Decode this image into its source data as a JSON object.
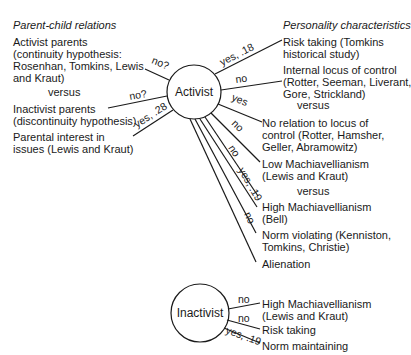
{
  "left": {
    "header": "Parent-child relations",
    "items": [
      {
        "lines": [
          "Activist parents",
          "(continuity hypothesis:",
          "Rosenhan, Tomkins, Lewis",
          "and Kraut)"
        ]
      },
      {
        "lines": [
          "versus"
        ]
      },
      {
        "lines": [
          "Inactivist parents",
          "(discontinuity hypothesis)"
        ]
      },
      {
        "lines": [
          "Parental interest in",
          "issues (Lewis and Kraut)"
        ]
      }
    ]
  },
  "right": {
    "header": "Personality characteristics",
    "items": [
      {
        "lines": [
          "Risk taking (Tomkins",
          "historical study)"
        ]
      },
      {
        "lines": [
          "Internal locus of control",
          "(Rotter, Seeman, Liverant,",
          "Gore, Strickland)"
        ]
      },
      {
        "lines": [
          "versus"
        ]
      },
      {
        "lines": [
          "No relation to locus of",
          "control (Rotter, Hamsher,",
          "Geller, Abramowitz)"
        ]
      },
      {
        "lines": [
          "Low Machiavellianism",
          "(Lewis and Kraut)"
        ]
      },
      {
        "lines": [
          "versus"
        ]
      },
      {
        "lines": [
          "High Machiavellianism",
          "(Bell)"
        ]
      },
      {
        "lines": [
          "Norm violating (Kenniston,",
          "Tomkins, Christie)"
        ]
      },
      {
        "lines": [
          "Alienation"
        ]
      }
    ]
  },
  "nodes": {
    "activist": "Activist",
    "inactivist": "Inactivist"
  },
  "activist_edges": [
    {
      "target": "Activist parents",
      "label": "no?"
    },
    {
      "target": "Inactivist parents",
      "label": "no?"
    },
    {
      "target": "Parental interest in issues",
      "label": "yes, .28"
    },
    {
      "target": "Risk taking",
      "label": "yes, .18"
    },
    {
      "target": "Internal locus of control",
      "label": "no"
    },
    {
      "target": "No relation to locus of control",
      "label": "yes"
    },
    {
      "target": "Low Machiavellianism",
      "label": "no"
    },
    {
      "target": "Low Machiavellianism (2)",
      "label": "no"
    },
    {
      "target": "High Machiavellianism",
      "label": "yes, .19"
    },
    {
      "target": "Norm violating",
      "label": "no"
    },
    {
      "target": "Alienation",
      "label": ""
    }
  ],
  "inactivist": {
    "items": [
      {
        "lines": [
          "High Machiavellianism",
          "(Lewis and Kraut)"
        ]
      },
      {
        "lines": [
          "Risk taking"
        ]
      },
      {
        "lines": [
          "Norm maintaining"
        ]
      }
    ],
    "edges": [
      {
        "target": "High Machiavellianism",
        "label": "no"
      },
      {
        "target": "Risk taking",
        "label": "no"
      },
      {
        "target": "Norm maintaining",
        "label": "yes, .19"
      }
    ]
  }
}
